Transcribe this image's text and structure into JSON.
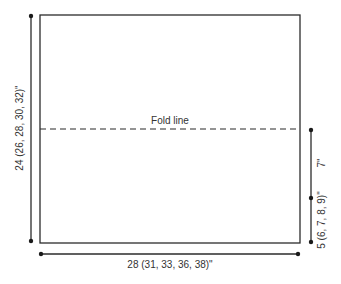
{
  "diagram": {
    "type": "schematic-measurement",
    "colors": {
      "line": "#2b2b2b",
      "text": "#333333",
      "background": "#ffffff"
    },
    "panel": {
      "shape": "rectangle"
    },
    "fold_line": {
      "label": "Fold line",
      "style": "dashed"
    },
    "dimensions": {
      "height": {
        "label": "24 (26, 28, 30, 32)\"",
        "side": "left",
        "orientation": "vertical"
      },
      "width": {
        "label": "28 (31, 33, 36, 38)\"",
        "side": "bottom",
        "orientation": "horizontal"
      },
      "upper_right": {
        "label": "7\"",
        "side": "right",
        "orientation": "vertical"
      },
      "lower_right": {
        "label": "5 (6, 7, 8, 9)\"",
        "side": "right",
        "orientation": "vertical"
      }
    }
  }
}
